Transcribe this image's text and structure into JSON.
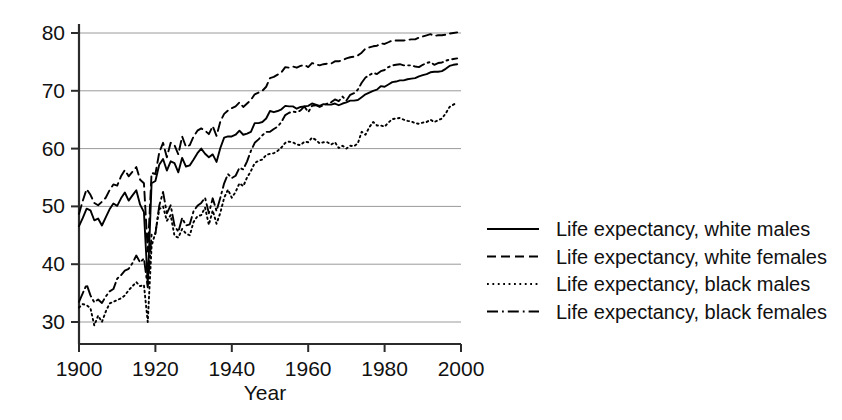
{
  "chart_data": {
    "type": "line",
    "title": "",
    "xlabel": "Year",
    "ylabel": "",
    "xlim": [
      1900,
      2000
    ],
    "ylim": [
      30,
      80
    ],
    "grid": true,
    "legend_position": "right",
    "xticks": [
      "1900",
      "1920",
      "1940",
      "1960",
      "1980",
      "2000"
    ],
    "xtick_values": [
      1900,
      1920,
      1940,
      1960,
      1980,
      2000
    ],
    "yticks": [
      "30",
      "40",
      "50",
      "60",
      "70",
      "80"
    ],
    "ytick_values": [
      30,
      40,
      50,
      60,
      70,
      80
    ],
    "x": [
      1900,
      1901,
      1902,
      1903,
      1904,
      1905,
      1906,
      1907,
      1908,
      1909,
      1910,
      1911,
      1912,
      1913,
      1914,
      1915,
      1916,
      1917,
      1918,
      1919,
      1920,
      1921,
      1922,
      1923,
      1924,
      1925,
      1926,
      1927,
      1928,
      1929,
      1930,
      1931,
      1932,
      1933,
      1934,
      1935,
      1936,
      1937,
      1938,
      1939,
      1940,
      1941,
      1942,
      1943,
      1944,
      1945,
      1946,
      1947,
      1948,
      1949,
      1950,
      1951,
      1952,
      1953,
      1954,
      1955,
      1956,
      1957,
      1958,
      1959,
      1960,
      1961,
      1962,
      1963,
      1964,
      1965,
      1966,
      1967,
      1968,
      1969,
      1970,
      1971,
      1972,
      1973,
      1974,
      1975,
      1976,
      1977,
      1978,
      1979,
      1980,
      1981,
      1982,
      1983,
      1984,
      1985,
      1986,
      1987,
      1988,
      1989,
      1990,
      1991,
      1992,
      1993,
      1994,
      1995,
      1996,
      1997,
      1998,
      1999
    ],
    "series": [
      {
        "name": "Life expectancy, white males",
        "style": "solid",
        "color": "#000000",
        "values": [
          46.6,
          48.0,
          49.6,
          49.3,
          47.6,
          47.9,
          46.7,
          48.1,
          49.5,
          50.5,
          50.1,
          51.4,
          52.4,
          51.0,
          51.9,
          52.8,
          50.3,
          49.0,
          36.6,
          54.0,
          54.4,
          57.2,
          58.2,
          56.2,
          57.8,
          57.5,
          55.9,
          58.4,
          56.9,
          57.1,
          58.1,
          59.2,
          60.0,
          59.1,
          58.5,
          59.0,
          57.7,
          60.1,
          61.9,
          62.1,
          62.1,
          62.4,
          63.1,
          62.4,
          62.6,
          62.9,
          64.4,
          64.4,
          64.6,
          65.2,
          66.5,
          66.3,
          66.5,
          66.8,
          67.4,
          67.3,
          67.3,
          66.9,
          67.2,
          67.3,
          67.4,
          67.8,
          67.6,
          67.4,
          67.7,
          67.6,
          67.6,
          67.8,
          67.5,
          67.8,
          68.0,
          68.3,
          68.3,
          68.4,
          68.9,
          69.4,
          69.7,
          70.0,
          70.2,
          70.8,
          70.7,
          71.1,
          71.5,
          71.6,
          71.8,
          71.8,
          72.0,
          72.1,
          72.2,
          72.5,
          72.7,
          72.9,
          73.2,
          73.3,
          73.3,
          73.4,
          73.8,
          74.3,
          74.5,
          74.6
        ]
      },
      {
        "name": "Life expectancy, white females",
        "style": "dashed",
        "color": "#000000",
        "values": [
          48.7,
          51.0,
          53.0,
          52.0,
          50.6,
          50.2,
          50.8,
          51.5,
          52.8,
          53.8,
          53.6,
          55.2,
          56.3,
          55.2,
          56.0,
          56.8,
          54.6,
          54.0,
          42.2,
          55.8,
          55.6,
          59.3,
          61.0,
          58.5,
          61.0,
          60.6,
          59.0,
          62.1,
          60.3,
          60.6,
          62.1,
          63.1,
          63.5,
          63.1,
          62.5,
          63.9,
          62.2,
          64.7,
          66.0,
          66.6,
          67.0,
          67.3,
          68.0,
          67.2,
          67.8,
          68.4,
          69.4,
          69.7,
          70.0,
          70.7,
          72.2,
          72.4,
          72.8,
          73.2,
          74.1,
          74.0,
          74.2,
          74.0,
          74.3,
          74.5,
          74.1,
          74.8,
          74.6,
          74.4,
          74.6,
          74.7,
          74.7,
          75.1,
          75.1,
          75.3,
          75.6,
          75.8,
          75.9,
          76.1,
          76.6,
          77.3,
          77.5,
          77.7,
          77.8,
          78.2,
          78.1,
          78.4,
          78.7,
          78.7,
          78.7,
          78.7,
          78.8,
          78.9,
          78.9,
          79.2,
          79.4,
          79.6,
          79.8,
          79.5,
          79.6,
          79.6,
          79.7,
          79.9,
          80.0,
          80.1
        ]
      },
      {
        "name": "Life expectancy, black males",
        "style": "dotted",
        "color": "#000000",
        "values": [
          32.5,
          33.1,
          32.9,
          32.4,
          29.4,
          31.1,
          30.0,
          31.8,
          33.2,
          33.5,
          33.8,
          34.1,
          34.6,
          35.5,
          36.2,
          36.9,
          36.2,
          36.4,
          30.0,
          43.1,
          45.5,
          49.5,
          50.0,
          47.5,
          48.5,
          44.9,
          44.6,
          46.1,
          45.3,
          45.0,
          47.3,
          48.3,
          48.5,
          49.8,
          46.8,
          49.3,
          47.0,
          48.9,
          51.5,
          52.9,
          51.5,
          52.5,
          54.0,
          53.5,
          55.0,
          56.1,
          57.5,
          57.9,
          58.1,
          58.9,
          59.1,
          59.2,
          59.6,
          60.2,
          61.0,
          61.2,
          61.1,
          60.7,
          60.6,
          61.2,
          61.1,
          61.9,
          61.5,
          60.9,
          61.1,
          61.1,
          60.7,
          61.1,
          60.1,
          60.5,
          60.0,
          60.5,
          60.4,
          60.9,
          62.9,
          62.4,
          63.7,
          64.6,
          64.0,
          64.0,
          63.8,
          64.5,
          65.1,
          65.2,
          65.3,
          65.0,
          64.8,
          64.7,
          64.4,
          64.3,
          64.5,
          64.6,
          65.0,
          64.6,
          64.9,
          65.2,
          66.1,
          67.2,
          67.6,
          68.0
        ]
      },
      {
        "name": "Life expectancy, black females",
        "style": "dashdot",
        "color": "#000000",
        "values": [
          33.5,
          35.0,
          36.5,
          34.6,
          33.4,
          33.9,
          33.3,
          34.4,
          35.3,
          35.7,
          37.5,
          38.1,
          38.9,
          39.2,
          40.2,
          41.5,
          40.3,
          41.0,
          36.0,
          45.1,
          45.2,
          50.1,
          52.5,
          48.8,
          50.2,
          46.7,
          45.6,
          48.0,
          46.7,
          46.9,
          49.2,
          50.1,
          50.6,
          51.5,
          48.8,
          51.4,
          49.2,
          51.5,
          54.0,
          55.6,
          54.9,
          55.3,
          56.7,
          56.4,
          57.8,
          59.6,
          61.0,
          61.6,
          62.3,
          62.9,
          62.9,
          63.4,
          63.8,
          64.6,
          65.8,
          66.2,
          66.4,
          66.3,
          66.6,
          67.3,
          66.3,
          67.4,
          67.5,
          67.2,
          67.5,
          67.8,
          68.0,
          68.5,
          68.2,
          69.0,
          68.3,
          69.3,
          69.6,
          70.2,
          71.4,
          72.3,
          72.7,
          73.1,
          72.9,
          73.4,
          73.6,
          74.1,
          74.4,
          74.5,
          74.6,
          74.4,
          74.4,
          74.4,
          74.2,
          74.1,
          74.5,
          74.8,
          75.0,
          74.5,
          74.8,
          74.9,
          75.2,
          75.4,
          75.5,
          75.6
        ]
      }
    ]
  },
  "legend": {
    "items": [
      {
        "label": "Life expectancy, white males",
        "style": "solid"
      },
      {
        "label": "Life expectancy, white females",
        "style": "dashed"
      },
      {
        "label": "Life expectancy, black males",
        "style": "dotted"
      },
      {
        "label": "Life expectancy, black females",
        "style": "dashdot"
      }
    ]
  }
}
